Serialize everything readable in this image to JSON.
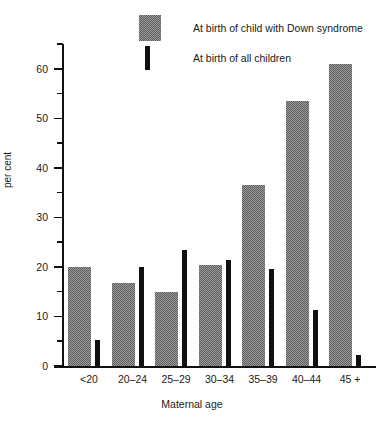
{
  "chart_data": {
    "type": "bar",
    "title": "",
    "xlabel": "Maternal age",
    "ylabel": "per cent",
    "categories": [
      "<20",
      "20–24",
      "25–29",
      "30–34",
      "35–39",
      "40–44",
      "45 +"
    ],
    "series": [
      {
        "name": "At birth of child with Down syndrome",
        "color": "#8a8a8a",
        "values": [
          20.0,
          16.7,
          15.0,
          20.3,
          36.5,
          53.5,
          61.0
        ]
      },
      {
        "name": "At birth of all children",
        "color": "#111111",
        "values": [
          5.3,
          20.0,
          23.5,
          21.3,
          19.5,
          11.3,
          2.3
        ]
      }
    ],
    "ylim": [
      0,
      65
    ],
    "yticks_major": [
      0,
      10,
      20,
      30,
      40,
      50,
      60
    ],
    "yticks_major_labels": [
      "0",
      "10",
      "20",
      "30",
      "40",
      "50",
      "60"
    ],
    "yticks_minor": [
      5,
      15,
      25,
      35,
      45,
      55,
      65
    ],
    "grid": false,
    "legend_position": "top-center"
  },
  "legend": {
    "items": [
      {
        "label": "At birth of child with Down syndrome",
        "swatch": "gray-hatch-swatch"
      },
      {
        "label": "At birth of all children",
        "swatch": "black-bar-swatch"
      }
    ]
  },
  "axes": {
    "y_axis_title": "per cent",
    "x_axis_title": "Maternal age"
  }
}
